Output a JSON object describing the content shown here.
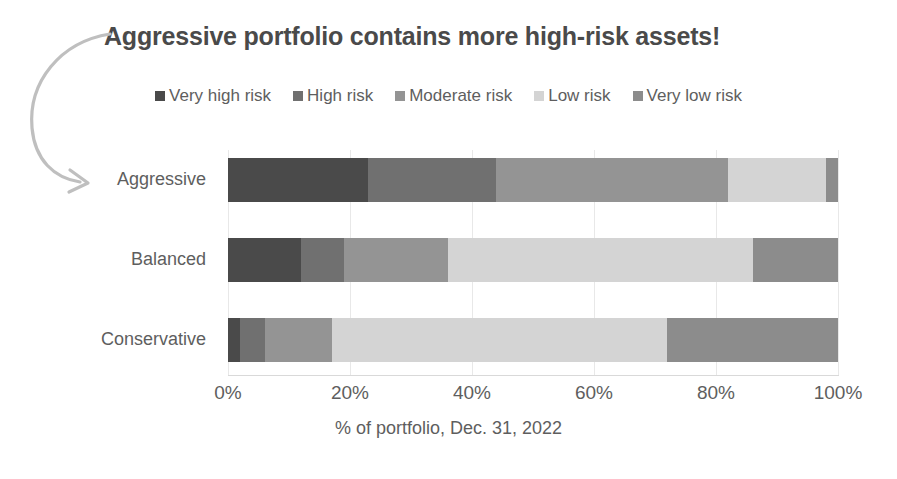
{
  "chart_data": {
    "type": "bar",
    "orientation": "horizontal",
    "stacked": true,
    "normalized_percent": true,
    "title": "Aggressive portfolio contains more high-risk assets!",
    "xlabel": "% of portfolio, Dec. 31, 2022",
    "ylabel": "",
    "xlim": [
      0,
      100
    ],
    "grid": "vertical",
    "legend_position": "top",
    "categories": [
      "Aggressive",
      "Balanced",
      "Conservative"
    ],
    "xtick_labels": [
      "0%",
      "20%",
      "40%",
      "60%",
      "80%",
      "100%"
    ],
    "xtick_values": [
      0,
      20,
      40,
      60,
      80,
      100
    ],
    "series": [
      {
        "name": "Very high risk",
        "color": "#4a4a4a",
        "values": [
          23,
          12,
          2
        ]
      },
      {
        "name": "High risk",
        "color": "#707070",
        "values": [
          21,
          7,
          4
        ]
      },
      {
        "name": "Moderate risk",
        "color": "#949494",
        "values": [
          38,
          17,
          11
        ]
      },
      {
        "name": "Low risk",
        "color": "#d4d4d4",
        "values": [
          16,
          50,
          55
        ]
      },
      {
        "name": "Very low risk",
        "color": "#8c8c8c",
        "values": [
          2,
          14,
          28
        ]
      }
    ],
    "annotations": [
      {
        "name": "curved-arrow-to-aggressive",
        "target": "Aggressive",
        "description": "Curved arrow from title sweeping left and down, pointing right at the Aggressive category label"
      }
    ]
  },
  "colors": {
    "title_text": "#4a4a4a",
    "axis_text": "#5e5e5e",
    "gridline": "#e8e8e8",
    "axis_line": "#d9d9d9",
    "annotation": "#bfbfbf",
    "background": "#ffffff"
  }
}
